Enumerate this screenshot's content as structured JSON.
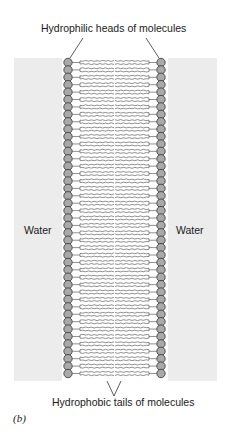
{
  "diagram": {
    "title_top": "Hydrophilic heads of molecules",
    "title_bottom": "Hydrophobic tails of molecules",
    "left_label": "Water",
    "right_label": "Water",
    "figure_label": "(b)",
    "head_count": 43,
    "colors": {
      "background_band": "#ececec",
      "head_fill": "#a9a9a9",
      "head_stroke": "#333333",
      "tail_stroke": "#444444"
    }
  }
}
